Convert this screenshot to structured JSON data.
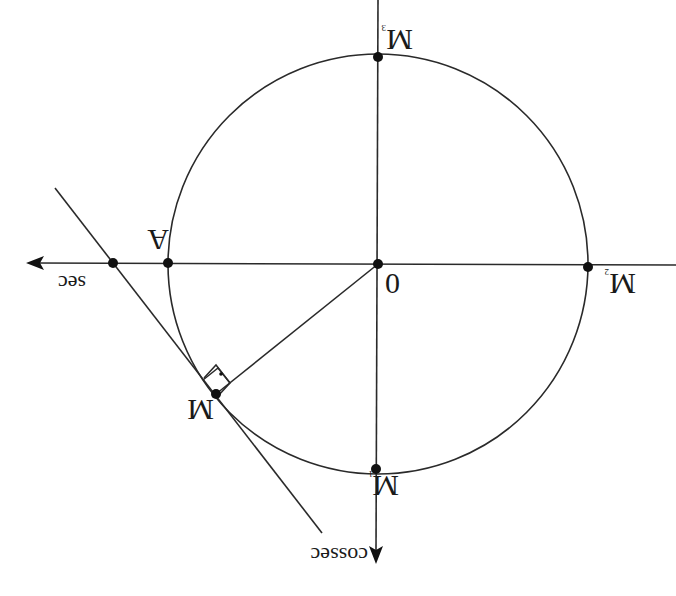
{
  "diagram": {
    "orientation": "rotated 180 degrees",
    "colors": {
      "line": "#2a2a2a",
      "point": "#111111",
      "text": "#1a1a1a",
      "background": "#ffffff"
    },
    "axes": {
      "horizontal_label": "sec",
      "vertical_label": "cossec"
    },
    "points": {
      "origin": {
        "label": "0"
      },
      "A": {
        "label": "A"
      },
      "M": {
        "label": "M"
      },
      "M1": {
        "label": "M",
        "subscript": "1"
      },
      "M2": {
        "label": "M",
        "subscript": "2"
      },
      "M3": {
        "label": "M",
        "subscript": "3"
      }
    },
    "annotations": {
      "right_angle": "right angle marker between radius OM and tangent at M"
    }
  }
}
